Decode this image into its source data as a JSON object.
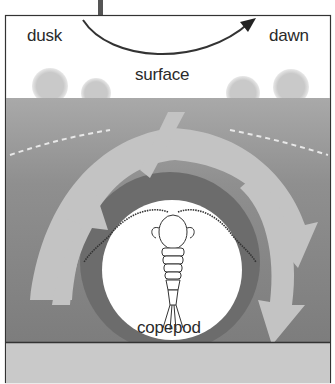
{
  "diagram": {
    "title_labels": {
      "dusk": "dusk",
      "dawn": "dawn",
      "surface": "surface",
      "organism": "copepod"
    },
    "elements": [
      {
        "type": "arc-arrow",
        "from": "dusk",
        "to": "dawn",
        "meaning": "time cycle"
      },
      {
        "type": "band",
        "name": "surface-layer",
        "color": "#ffffff"
      },
      {
        "type": "band",
        "name": "deep-water",
        "color": "#8a8a8a"
      },
      {
        "type": "arrow",
        "name": "ascent-arrows-left"
      },
      {
        "type": "arrow",
        "name": "descent-arrows-right"
      },
      {
        "type": "circle",
        "name": "copepod-spotlight",
        "color": "#ffffff"
      }
    ],
    "colors": {
      "sky": "#ffffff",
      "water_top": "#b5b5b5",
      "water_deep": "#7e7e7e",
      "arrow_fill": "#c2c2c2",
      "dark_ring": "#6a6a6a",
      "text": "#2a2a2a",
      "bottom_strip": "#c8c8c8"
    }
  }
}
